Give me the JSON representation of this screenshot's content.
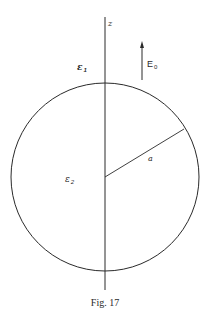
{
  "figure": {
    "caption": "Fig. 17",
    "axis_label": "z",
    "region_outside": {
      "symbol": "ε",
      "subscript": "1"
    },
    "region_inside": {
      "symbol": "ε",
      "subscript": "2"
    },
    "field": {
      "symbol": "E",
      "subscript": "0",
      "direction": "up"
    },
    "radius_label": "a",
    "colors": {
      "stroke": "#2a2a2a",
      "background": "#ffffff"
    },
    "geometry": {
      "sphere_center": [
        105,
        177
      ],
      "sphere_radius": 94,
      "axis_x": 105,
      "axis_y_range": [
        17,
        290
      ],
      "radius_endpoint": [
        184,
        129
      ],
      "field_arrow": {
        "x": 142,
        "y_from": 80,
        "y_to": 42
      }
    }
  }
}
